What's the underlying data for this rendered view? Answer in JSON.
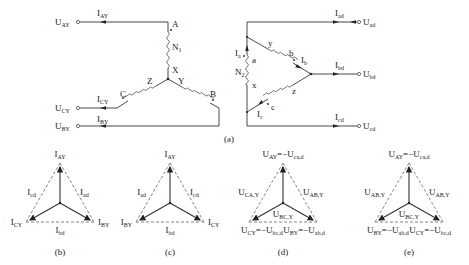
{
  "figure_a": {
    "caption": "(a)",
    "primary": {
      "terminals": [
        {
          "voltage": "U",
          "voltage_sub": "AY",
          "current": "I",
          "current_sub": "AY"
        },
        {
          "voltage": "U",
          "voltage_sub": "CY",
          "current": "I",
          "current_sub": "CY"
        },
        {
          "voltage": "U",
          "voltage_sub": "BY",
          "current": "I",
          "current_sub": "BY"
        }
      ],
      "nodes": {
        "A": "A",
        "X": "X",
        "Y": "Y",
        "Z": "Z",
        "B": "B",
        "C": "C"
      },
      "winding": "N",
      "winding_sub": "1"
    },
    "secondary": {
      "terminals": [
        {
          "voltage": "U",
          "voltage_sub": "ad",
          "current": "I",
          "current_sub": "ad"
        },
        {
          "voltage": "U",
          "voltage_sub": "bd",
          "current": "I",
          "current_sub": "bd"
        },
        {
          "voltage": "U",
          "voltage_sub": "cd",
          "current": "I",
          "current_sub": "cd"
        }
      ],
      "nodes": {
        "a": "a",
        "x": "x",
        "y": "y",
        "b": "b",
        "z": "z",
        "c": "c"
      },
      "winding": "N",
      "winding_sub": "2",
      "branch_currents": [
        {
          "name": "I",
          "sub": "a"
        },
        {
          "name": "I",
          "sub": "b"
        },
        {
          "name": "I",
          "sub": "c"
        }
      ]
    }
  },
  "phasors": [
    {
      "caption": "(b)",
      "top": {
        "m": "I",
        "s": "AY"
      },
      "left": {
        "m": "I",
        "s": "CY"
      },
      "right": {
        "m": "I",
        "s": "BY"
      },
      "edge_left": {
        "m": "I",
        "s": "cd"
      },
      "edge_right": {
        "m": "I",
        "s": "ad"
      },
      "edge_bottom": {
        "m": "I",
        "s": "bd"
      }
    },
    {
      "caption": "(c)",
      "top": {
        "m": "I",
        "s": "AY"
      },
      "left": {
        "m": "I",
        "s": "BY"
      },
      "right": {
        "m": "I",
        "s": "CY"
      },
      "edge_left": {
        "m": "I",
        "s": "ad"
      },
      "edge_right": {
        "m": "I",
        "s": "cd"
      },
      "edge_bottom": {
        "m": "I",
        "s": "bd"
      }
    },
    {
      "caption": "(d)",
      "top": {
        "m": "U",
        "s": "AY",
        "eq": "=−U",
        "eqs": "ca,d"
      },
      "left": {
        "m": "U",
        "s": "CY",
        "eq": "=−U",
        "eqs": "bc,d"
      },
      "right": {
        "m": "U",
        "s": "BY",
        "eq": "=−U",
        "eqs": "ab,d"
      },
      "edge_left": {
        "m": "U",
        "s": "CA,Y"
      },
      "edge_right": {
        "m": "U",
        "s": "AB,Y"
      },
      "edge_bottom": {
        "m": "U",
        "s": "BC,Y"
      }
    },
    {
      "caption": "(e)",
      "top": {
        "m": "U",
        "s": "AY",
        "eq": "=−U",
        "eqs": "ca,d"
      },
      "left": {
        "m": "U",
        "s": "BY",
        "eq": "=−U",
        "eqs": "ab,d"
      },
      "right": {
        "m": "U",
        "s": "CY",
        "eq": "=−U",
        "eqs": "bc,d"
      },
      "edge_left": {
        "m": "U",
        "s": "AB,Y"
      },
      "edge_right": {
        "m": "U",
        "s": "AB,Y"
      },
      "edge_bottom": {
        "m": "U",
        "s": "BC,Y"
      }
    }
  ]
}
